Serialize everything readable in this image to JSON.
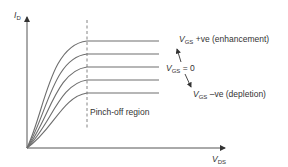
{
  "axes": {
    "y_label_main": "I",
    "y_label_sub": "D",
    "x_label_main": "V",
    "x_label_sub": "DS"
  },
  "annotations": {
    "enhancement": {
      "var": "V",
      "sub": "GS",
      "text": " +ve (enhancement)"
    },
    "zero": {
      "var": "V",
      "sub": "GS",
      "text": " = 0"
    },
    "depletion": {
      "var": "V",
      "sub": "GS",
      "text": " –ve (depletion)"
    },
    "pinch_off": "Pinch-off region"
  },
  "colors": {
    "curve": "#6e6e6e",
    "axis": "#555555",
    "dashed": "#777777",
    "text": "#333333"
  },
  "curves": {
    "plateau_levels_px": [
      41,
      54,
      67,
      80,
      93
    ],
    "count": 5
  }
}
